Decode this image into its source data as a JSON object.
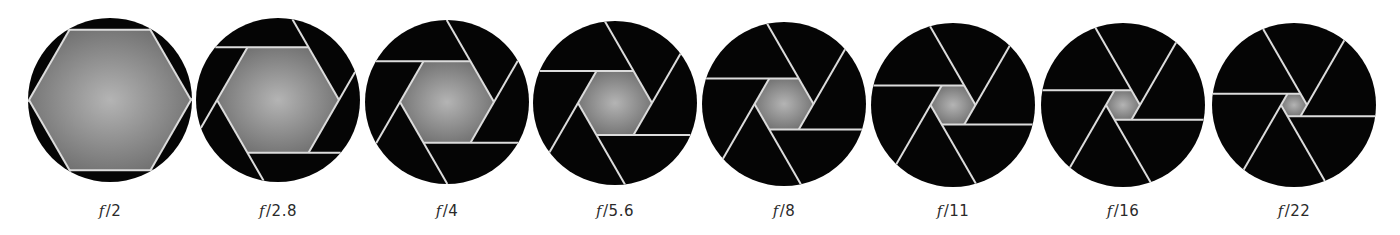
{
  "figure": {
    "blade_count": 6,
    "colors": {
      "blade": "#050505",
      "blade_edge": "#dcdcdc",
      "opening_center": "#b4b4b4",
      "opening_edge": "#6b6b6b",
      "label": "#2a2a2a",
      "background": "#ffffff"
    },
    "circle_radius": 82,
    "apertures": [
      {
        "label_prefix": "f",
        "label_value": "/2",
        "cx": 110,
        "cy": 100,
        "hex_radius": 81
      },
      {
        "label_prefix": "f",
        "label_value": "/2.8",
        "cx": 278,
        "cy": 100,
        "hex_radius": 61
      },
      {
        "label_prefix": "f",
        "label_value": "/4",
        "cx": 447,
        "cy": 102,
        "hex_radius": 47
      },
      {
        "label_prefix": "f",
        "label_value": "/5.6",
        "cx": 615,
        "cy": 103,
        "hex_radius": 37
      },
      {
        "label_prefix": "f",
        "label_value": "/8",
        "cx": 784,
        "cy": 104,
        "hex_radius": 29.5
      },
      {
        "label_prefix": "f",
        "label_value": "/11",
        "cx": 953,
        "cy": 105,
        "hex_radius": 22.5
      },
      {
        "label_prefix": "f",
        "label_value": "/16",
        "cx": 1123,
        "cy": 105,
        "hex_radius": 17
      },
      {
        "label_prefix": "f",
        "label_value": "/22",
        "cx": 1294,
        "cy": 105,
        "hex_radius": 13
      }
    ]
  }
}
